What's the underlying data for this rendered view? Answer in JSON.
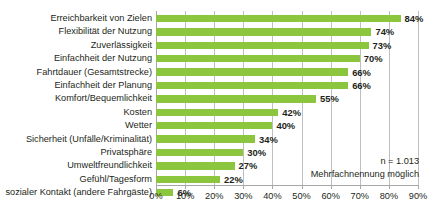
{
  "chart_data": {
    "type": "bar",
    "orientation": "horizontal",
    "title": "",
    "subtitle": "",
    "xlabel": "",
    "ylabel": "",
    "xlim": [
      0,
      90
    ],
    "grid": true,
    "legend": false,
    "value_suffix": "%",
    "bar_color": "#8CC63E",
    "categories": [
      "Erreichbarkeit von Zielen",
      "Flexibilität der Nutzung",
      "Zuverlässigkeit",
      "Einfachheit der Nutzung",
      "Fahrtdauer (Gesamtstrecke)",
      "Einfachheit der Planung",
      "Komfort/Bequemlichkeit",
      "Kosten",
      "Wetter",
      "Sicherheit (Unfälle/Kriminalität)",
      "Privatsphäre",
      "Umweltfreundlichkeit",
      "Gefühl/Tagesform",
      "sozialer Kontakt (andere Fahrgäste)"
    ],
    "values": [
      84,
      74,
      73,
      70,
      66,
      66,
      55,
      42,
      40,
      34,
      30,
      27,
      22,
      6
    ],
    "value_labels": [
      "84%",
      "74%",
      "73%",
      "70%",
      "66%",
      "66%",
      "55%",
      "42%",
      "40%",
      "34%",
      "30%",
      "27%",
      "22%",
      "6%"
    ],
    "xticks": [
      0,
      10,
      20,
      30,
      40,
      50,
      60,
      70,
      80,
      90
    ],
    "xtick_labels": [
      "0%",
      "10%",
      "20%",
      "30%",
      "40%",
      "50%",
      "60%",
      "70%",
      "80%",
      "90%"
    ]
  },
  "annotation": {
    "sample_size": "n = 1.013",
    "note": "Mehrfachnennung möglich"
  }
}
